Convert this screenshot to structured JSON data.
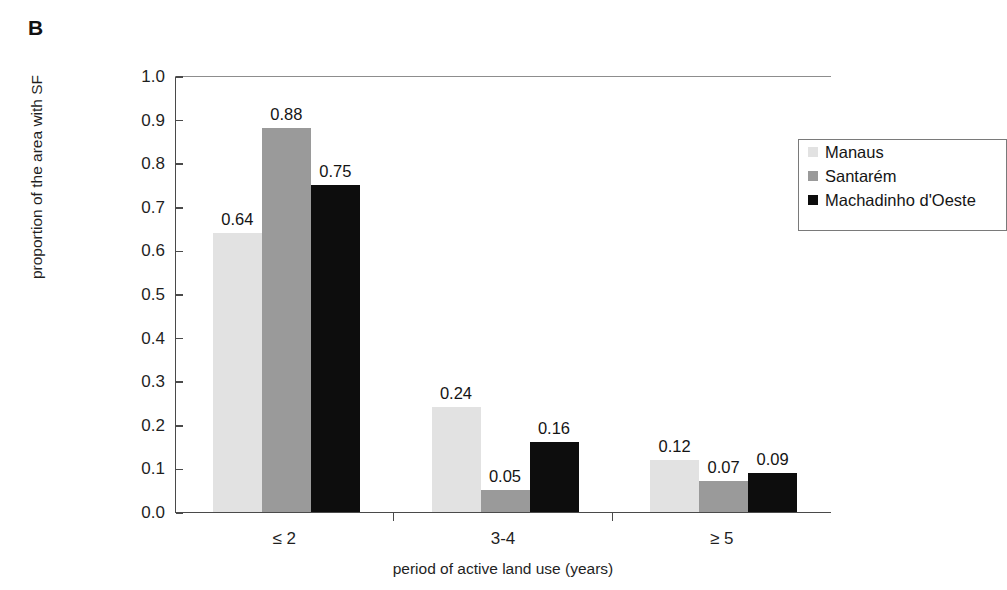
{
  "panel": {
    "label": "B"
  },
  "chart_data": {
    "type": "bar",
    "title": "",
    "xlabel": "period of active land use (years)",
    "ylabel": "proportion of the area with SF",
    "categories": [
      "≤ 2",
      "3-4",
      "≥ 5"
    ],
    "ylim": [
      0.0,
      1.0
    ],
    "ytick_step": 0.1,
    "ytick_labels": [
      "0.0",
      "0.1",
      "0.2",
      "0.3",
      "0.4",
      "0.5",
      "0.6",
      "0.7",
      "0.8",
      "0.9",
      "1.0"
    ],
    "grid": false,
    "legend_position": "top-right-inside",
    "series": [
      {
        "name": "Manaus",
        "color": "#e2e2e2",
        "values": [
          0.64,
          0.24,
          0.12
        ],
        "labels": [
          "0.64",
          "0.24",
          "0.12"
        ]
      },
      {
        "name": "Santarém",
        "color": "#9a9a9a",
        "values": [
          0.88,
          0.05,
          0.07
        ],
        "labels": [
          "0.88",
          "0.05",
          "0.07"
        ]
      },
      {
        "name": "Machadinho d'Oeste",
        "color": "#0d0d0d",
        "values": [
          0.75,
          0.16,
          0.09
        ],
        "labels": [
          "0.75",
          "0.16",
          "0.09"
        ]
      }
    ]
  },
  "axis_colors": {
    "axis_line": "#4a4a4a",
    "text": "#1f1f1f",
    "legend_border": "#7a7a7a"
  }
}
